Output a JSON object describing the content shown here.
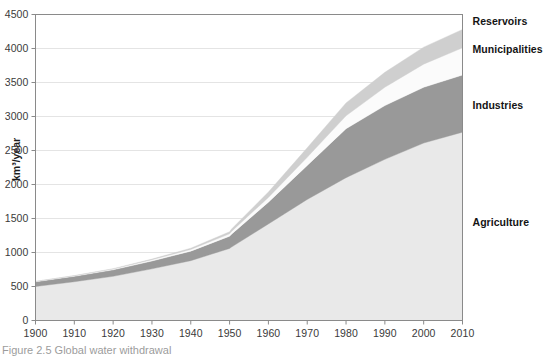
{
  "figure": {
    "caption": "Figure 2.5  Global water withdrawal"
  },
  "chart_data": {
    "type": "area",
    "stacked": true,
    "title": "",
    "xlabel": "",
    "ylabel": "km³/year",
    "xlim": [
      1900,
      2010
    ],
    "ylim": [
      0,
      4500
    ],
    "grid": true,
    "grid_axis": "y",
    "legend": "inline-right-labels",
    "x": [
      1900,
      1910,
      1920,
      1930,
      1940,
      1950,
      1950.5,
      1960,
      1970,
      1980,
      1990,
      2000,
      2010
    ],
    "xticks": [
      "1900",
      "1910",
      "1920",
      "1930",
      "1940",
      "1950",
      "1960",
      "1970",
      "1980",
      "1990",
      "2000",
      "2010"
    ],
    "xtick_values": [
      1900,
      1910,
      1920,
      1930,
      1940,
      1950,
      1960,
      1970,
      1980,
      1990,
      2000,
      2010
    ],
    "yticks": [
      "0",
      "500",
      "1000",
      "1500",
      "2000",
      "2500",
      "3000",
      "3500",
      "4000",
      "4500"
    ],
    "ytick_values": [
      0,
      500,
      1000,
      1500,
      2000,
      2500,
      3000,
      3500,
      4000,
      4500
    ],
    "series": [
      {
        "name": "Agriculture",
        "color": "#e9e9e9",
        "label_x": 2013,
        "label_y": 1430,
        "values": [
          500,
          570,
          650,
          760,
          880,
          1060,
          1080,
          1420,
          1780,
          2100,
          2370,
          2610,
          2770
        ]
      },
      {
        "name": "Industries",
        "color": "#999999",
        "label_x": 2013,
        "label_y": 3160,
        "values": [
          70,
          80,
          95,
          115,
          140,
          180,
          190,
          320,
          500,
          720,
          790,
          820,
          840
        ]
      },
      {
        "name": "Municipalities",
        "color": "#fbfbfb",
        "label_x": 2013,
        "label_y": 3985,
        "values": [
          5,
          8,
          12,
          18,
          25,
          35,
          40,
          70,
          120,
          190,
          270,
          340,
          400
        ]
      },
      {
        "name": "Reservoirs",
        "color": "#cfcfcf",
        "label_x": 2013,
        "label_y": 4390,
        "values": [
          0,
          2,
          5,
          10,
          18,
          30,
          35,
          80,
          140,
          190,
          220,
          250,
          270
        ]
      }
    ],
    "totals": [
      575,
      660,
      762,
      903,
      1063,
      1305,
      1345,
      1890,
      2540,
      3210,
      3650,
      4020,
      4280
    ]
  },
  "axes": {
    "y_axis_title": "km³/year"
  }
}
